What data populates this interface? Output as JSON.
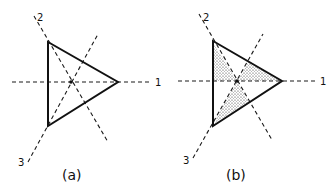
{
  "figure": {
    "panels": [
      {
        "id": "a",
        "caption": "(a)",
        "axis_labels": {
          "axis1": "1",
          "axis2": "2",
          "axis3": "3"
        },
        "shaded": false
      },
      {
        "id": "b",
        "caption": "(b)",
        "axis_labels": {
          "axis1": "1",
          "axis2": "2",
          "axis3": "3"
        },
        "shaded": true,
        "shaded_regions": 3
      }
    ],
    "colors": {
      "line": "#111111",
      "background": "#ffffff",
      "stipple": "#333333"
    }
  }
}
